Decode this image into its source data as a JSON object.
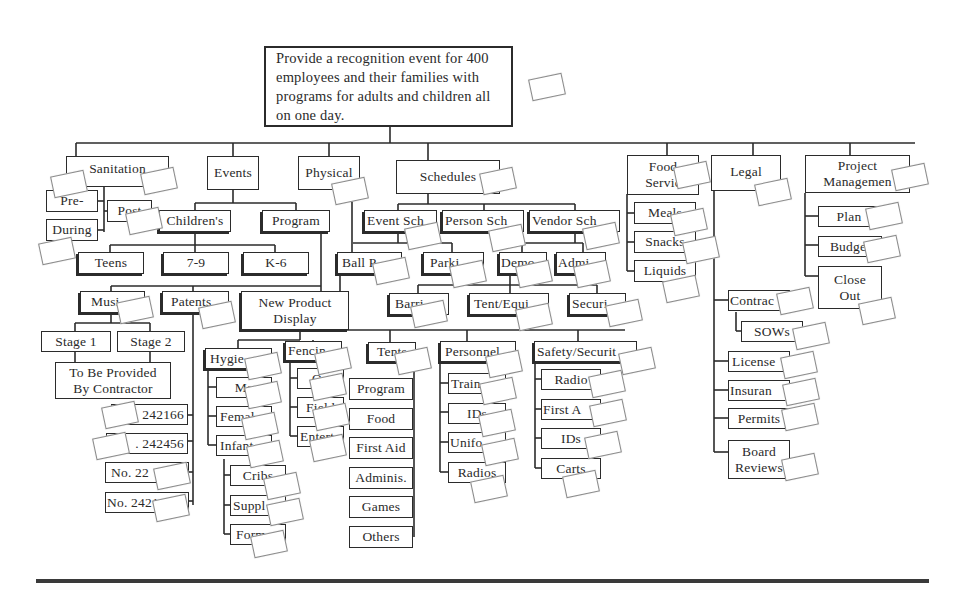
{
  "diagram": {
    "type": "work-breakdown-structure",
    "root": "Provide a recognition event for 400 employees and their families with programs for adults and children all on one day.",
    "branches": {
      "sanitation": {
        "label": "Sanitation",
        "children": [
          "Pre-",
          "Post",
          "During"
        ]
      },
      "events": {
        "label": "Events",
        "children": {
          "childrens": {
            "label": "Children's",
            "children": [
              "Teens",
              "7-9",
              "K-6"
            ]
          },
          "program": {
            "label": "Program"
          },
          "music": {
            "label": "Music",
            "children": [
              "Stage 1",
              "Stage 2"
            ],
            "note": "To Be Provided By Contractor"
          },
          "patents": {
            "label": "Patents",
            "children": [
              "242166",
              "242456",
              "No. 22",
              "No. 2421"
            ]
          },
          "new_product_display": {
            "label": "New Product Display"
          }
        }
      },
      "physical": {
        "label": "Physical",
        "children": {
          "ball_park": "Ball P...",
          "hygiene": {
            "label": "Hygie...",
            "children": [
              "Ma...",
              "Femal...",
              "Infant..."
            ],
            "infant_children": [
              "Cribs",
              "Suppl...",
              "Form..."
            ]
          },
          "fencing": {
            "label": "Fencing",
            "children": [
              "Out...",
              "Field",
              "Entert..."
            ]
          },
          "tents": {
            "label": "Tents",
            "children": [
              "Program",
              "Food",
              "First Aid",
              "Adminis.",
              "Games",
              "Others"
            ]
          },
          "personnel": {
            "label": "Personnel",
            "children": [
              "Train...",
              "IDs",
              "Unifo...",
              "Radios"
            ]
          },
          "safety_security": {
            "label": "Safety/Security",
            "children": [
              "Radio",
              "First Aid",
              "IDs",
              "Carts"
            ]
          }
        }
      },
      "schedules": {
        "label": "Schedules",
        "children": [
          "Event Sch.",
          "Person Sch.",
          "Vendor Sch."
        ],
        "grandchildren": [
          "Parking",
          "Demo",
          "Admin",
          "Barriers",
          "Tent/Equip",
          "Security"
        ]
      },
      "food_service": {
        "label": "Food Service",
        "children": [
          "Meals",
          "Snacks",
          "Liquids"
        ]
      },
      "legal": {
        "label": "Legal",
        "children": [
          "Contracts",
          "SOWs",
          "Licenses",
          "Insurance",
          "Permits",
          "Board Reviews"
        ]
      },
      "project_management": {
        "label": "Project Management",
        "children": [
          "Plan",
          "Budget",
          "Close Out"
        ]
      }
    }
  },
  "labels": {
    "root": "Provide a recognition event for 400 employees and their families with programs for adults and children all on one day.",
    "sanitation": "Sanitation",
    "pre": "Pre-",
    "post": "Post",
    "during": "During",
    "events": "Events",
    "childrens": "Children's",
    "program": "Program",
    "teens": "Teens",
    "age79": "7-9",
    "k6": "K-6",
    "music": "Musi",
    "patents": "Patents",
    "npd": "New Product Display",
    "stage1": "Stage 1",
    "stage2": "Stage 2",
    "contractor": "To Be Provided By Contractor",
    "pat1": "242166",
    "pat2": ". 242456",
    "pat3": "No. 22",
    "pat4": "No. 2421",
    "physical": "Physical",
    "schedules": "Schedules",
    "event_sch": "Event Sch",
    "person_sch": "Person Sch",
    "vendor_sch": "Vendor Sch",
    "ballpark": "Ball P",
    "parking": "Parki",
    "demo": "Demo",
    "admin": "Admi",
    "barriers": "Barri",
    "tent_equip": "Tent/Equi",
    "security": "Securi",
    "hygiene": "Hygie",
    "male": "Ma",
    "female": "Femal",
    "infant": "Infant",
    "cribs": "Cribs",
    "supplies": "Suppl",
    "formula": "Form",
    "fencing": "Fencin",
    "out": "Ou",
    "field": "Field",
    "entert": "Entert",
    "tents": "Tents",
    "t_program": "Program",
    "t_food": "Food",
    "t_firstaid": "First Aid",
    "t_adminis": "Adminis.",
    "t_games": "Games",
    "t_others": "Others",
    "personnel": "Personnel",
    "training": "Train",
    "ids": "IDs",
    "uniforms": "Unifo",
    "radios": "Radios",
    "safety": "Safety/Securit",
    "s_radio": "Radio",
    "s_firstaid": "First A",
    "s_ids": "IDs",
    "s_carts": "Carts",
    "food_service": "Food Servic",
    "meals": "Meals",
    "snacks": "Snacks",
    "liquids": "Liquids",
    "legal": "Legal",
    "contracts": "Contrac",
    "sows": "SOWs",
    "licenses": "License",
    "insurance": "Insuran",
    "permits": "Permits",
    "board": "Board Reviews",
    "pm": "Project Managemen",
    "plan": "Plan",
    "budget": "Budget",
    "closeout": "Close Out"
  },
  "colors": {
    "line": "#2b2b2b",
    "background": "#ffffff",
    "note_border": "#8a8a8a",
    "rule": "#3a3a3a"
  }
}
